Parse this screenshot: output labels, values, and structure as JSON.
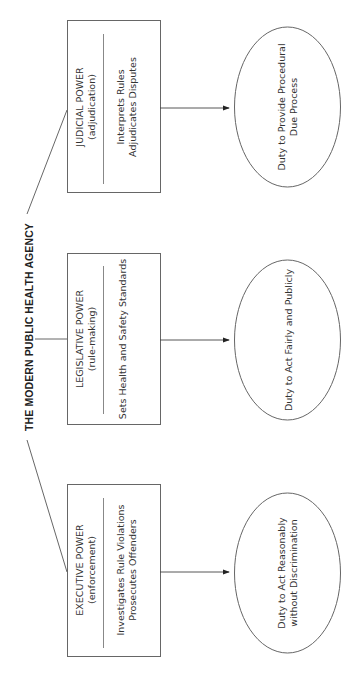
{
  "diagram": {
    "title": "THE MODERN PUBLIC HEALTH AGENCY",
    "orientation": "rotated -90deg (reads bottom-to-top)",
    "powers": [
      {
        "name": "JUDICIAL POWER",
        "subtitle": "(adjudication)",
        "functions": [
          "Interprets Rules",
          "Adjudicates Disputes"
        ],
        "duty": [
          "Duty to Provide Procedural",
          "Due Process"
        ]
      },
      {
        "name": "LEGISLATIVE POWER",
        "subtitle": "(rule-making)",
        "functions": [
          "Sets Health and Safety Standards"
        ],
        "duty": [
          "Duty to Act Fairly and Publicly"
        ]
      },
      {
        "name": "EXECUTIVE POWER",
        "subtitle": "(enforcement)",
        "functions": [
          "Investigates Rule Violations",
          "Prosecutes Offenders"
        ],
        "duty": [
          "Duty to Act Reasonably",
          "without Discrimination"
        ]
      }
    ],
    "colors": {
      "stroke": "#555555",
      "divider": "#777777",
      "text": "#333333",
      "background": "#ffffff"
    }
  }
}
